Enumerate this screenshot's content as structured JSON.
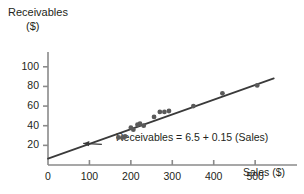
{
  "chart_data": {
    "type": "scatter",
    "title": "",
    "xlabel": "Sales ($)",
    "ylabel_line1": "Receivables",
    "ylabel_line2": "($)",
    "xlim": [
      0,
      560
    ],
    "ylim": [
      0,
      112
    ],
    "xticks": [
      0,
      100,
      200,
      300,
      400,
      500
    ],
    "xtick_labels": [
      "0",
      "100",
      "200",
      "300",
      "400",
      "500"
    ],
    "yticks": [
      20,
      40,
      60,
      80,
      100
    ],
    "ytick_labels": [
      "20",
      "40",
      "60",
      "80",
      "100"
    ],
    "grid": false,
    "legend": null,
    "points": [
      {
        "x": 170,
        "y": 28
      },
      {
        "x": 180,
        "y": 28
      },
      {
        "x": 186,
        "y": 29
      },
      {
        "x": 200,
        "y": 38
      },
      {
        "x": 206,
        "y": 36
      },
      {
        "x": 216,
        "y": 41
      },
      {
        "x": 222,
        "y": 42
      },
      {
        "x": 231,
        "y": 40
      },
      {
        "x": 256,
        "y": 49
      },
      {
        "x": 270,
        "y": 54
      },
      {
        "x": 281,
        "y": 54
      },
      {
        "x": 292,
        "y": 55
      },
      {
        "x": 351,
        "y": 60
      },
      {
        "x": 421,
        "y": 73
      },
      {
        "x": 505,
        "y": 81
      }
    ],
    "fit_line": {
      "intercept": 6.5,
      "slope": 0.15,
      "x_start": 0,
      "x_end": 545
    },
    "annotation": {
      "text": "Receivables  =  6.5  +  0.15 (Sales)",
      "arrow_from_x": 130,
      "arrow_from_y": 21,
      "arrow_to_x": 85,
      "arrow_to_y": 22
    },
    "colors": {
      "axis": "#8a8a8a",
      "line": "#3a3a3a",
      "point": "#5a5a5a",
      "text": "#231f20"
    }
  }
}
